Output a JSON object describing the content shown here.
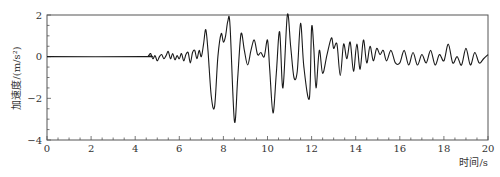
{
  "chart_data": {
    "type": "line",
    "title": "",
    "xlabel": "时间/s",
    "ylabel": "加速度/(m/s²)",
    "xlim": [
      0,
      20
    ],
    "ylim": [
      -4,
      2
    ],
    "x_ticks": [
      0,
      2,
      4,
      6,
      8,
      10,
      12,
      14,
      16,
      18,
      20
    ],
    "x_tick_labels": [
      "0",
      "2",
      "4",
      "6",
      "8",
      "10",
      "12",
      "14",
      "16",
      "18",
      "20"
    ],
    "x_minor_step": 0.5,
    "y_ticks": [
      2,
      0,
      -2,
      -4
    ],
    "y_tick_labels": [
      "2",
      "0",
      "−2",
      "−4"
    ],
    "y_minor_step": 0.5,
    "grid": false,
    "legend": null,
    "series": [
      {
        "name": "acceleration",
        "color": "#1a1a1a",
        "x": [
          0,
          4.4,
          4.6,
          4.7,
          4.8,
          4.9,
          5.0,
          5.1,
          5.2,
          5.3,
          5.4,
          5.5,
          5.6,
          5.7,
          5.8,
          5.9,
          6.0,
          6.1,
          6.2,
          6.3,
          6.4,
          6.5,
          6.6,
          6.7,
          6.8,
          6.9,
          7.0,
          7.1,
          7.2,
          7.3,
          7.45,
          7.6,
          7.75,
          7.9,
          8.0,
          8.1,
          8.2,
          8.3,
          8.5,
          8.65,
          8.8,
          8.95,
          9.1,
          9.25,
          9.4,
          9.55,
          9.7,
          9.85,
          10.0,
          10.1,
          10.25,
          10.4,
          10.55,
          10.7,
          10.9,
          11.05,
          11.2,
          11.35,
          11.5,
          11.65,
          11.9,
          12.0,
          12.1,
          12.2,
          12.35,
          12.5,
          12.7,
          12.9,
          13.0,
          13.15,
          13.3,
          13.45,
          13.6,
          13.75,
          13.9,
          14.05,
          14.2,
          14.35,
          14.5,
          14.65,
          14.8,
          14.95,
          15.1,
          15.25,
          15.4,
          15.6,
          15.8,
          16.0,
          16.2,
          16.4,
          16.6,
          16.8,
          17.0,
          17.2,
          17.4,
          17.6,
          17.8,
          18.0,
          18.2,
          18.4,
          18.6,
          18.8,
          19.0,
          19.2,
          19.4,
          19.6,
          19.8,
          20.0
        ],
        "y": [
          0,
          0,
          0.05,
          0.15,
          -0.1,
          0.05,
          -0.2,
          0.0,
          0.1,
          -0.1,
          0.05,
          0.25,
          -0.1,
          0.15,
          -0.15,
          0.05,
          -0.1,
          0.15,
          -0.2,
          0.1,
          0.2,
          -0.3,
          0.2,
          0.3,
          -0.1,
          0.3,
          0.0,
          0.6,
          1.3,
          0.3,
          -1.9,
          -2.4,
          0.0,
          1.1,
          0.7,
          1.0,
          1.7,
          1.5,
          -3.1,
          -1.0,
          1.1,
          0.3,
          -0.4,
          0.3,
          0.8,
          0.1,
          0.2,
          0.0,
          0.8,
          -0.6,
          -2.7,
          -0.8,
          1.2,
          -1.5,
          2.0,
          0.5,
          -1.0,
          -0.7,
          1.6,
          -0.5,
          -2.0,
          1.4,
          0.4,
          -1.5,
          0.3,
          -0.8,
          0.1,
          0.9,
          0.4,
          0.6,
          -0.9,
          0.6,
          -0.1,
          0.7,
          -0.7,
          0.6,
          -0.6,
          0.8,
          -0.3,
          0.5,
          -0.2,
          0.4,
          0.1,
          0.3,
          -0.2,
          0.3,
          -0.3,
          -0.3,
          0.3,
          -0.4,
          0.2,
          -0.4,
          0.1,
          -0.3,
          0.3,
          -0.4,
          0.1,
          -0.2,
          0.6,
          -0.3,
          0.0,
          -0.4,
          0.4,
          -0.4,
          0.2,
          -0.3,
          -0.1,
          0.1
        ]
      }
    ]
  }
}
